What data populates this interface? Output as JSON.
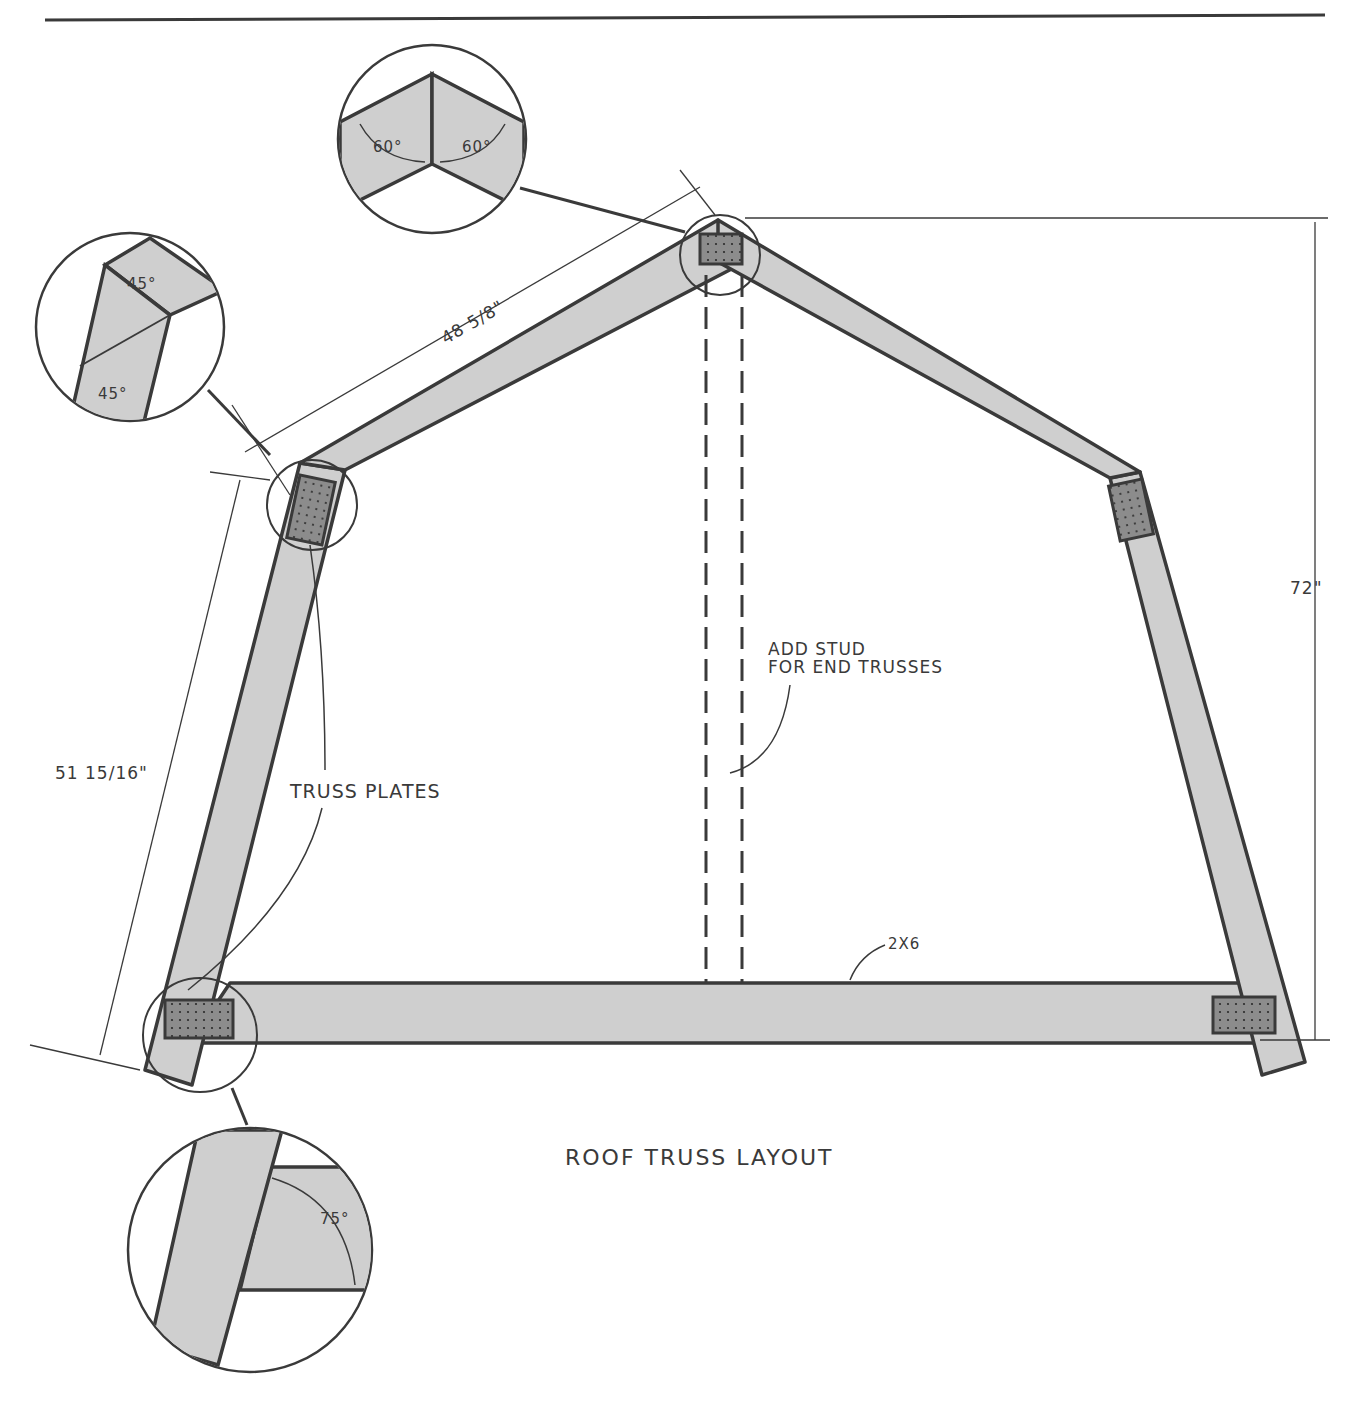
{
  "drawing": {
    "title": "ROOF TRUSS LAYOUT",
    "callouts": {
      "truss_plates": "TRUSS PLATES",
      "add_stud": [
        "ADD STUD",
        "FOR END TRUSSES"
      ],
      "lumber": "2X6"
    },
    "dimensions": {
      "upper_chord_length": "48 5/8\"",
      "lower_chord_length": "51 15/16\"",
      "overall_height": "72\""
    },
    "details": [
      {
        "name": "ridge-joint",
        "angles": [
          "60°",
          "60°"
        ]
      },
      {
        "name": "knee-joint",
        "angles": [
          "45°",
          "45°"
        ]
      },
      {
        "name": "heel-joint",
        "angles": [
          "75°"
        ]
      }
    ],
    "colors": {
      "line": "#3a3a3a",
      "member_fill": "#cfcfcf",
      "plate_fill": "#8c8c8c",
      "background": "#ffffff"
    }
  }
}
